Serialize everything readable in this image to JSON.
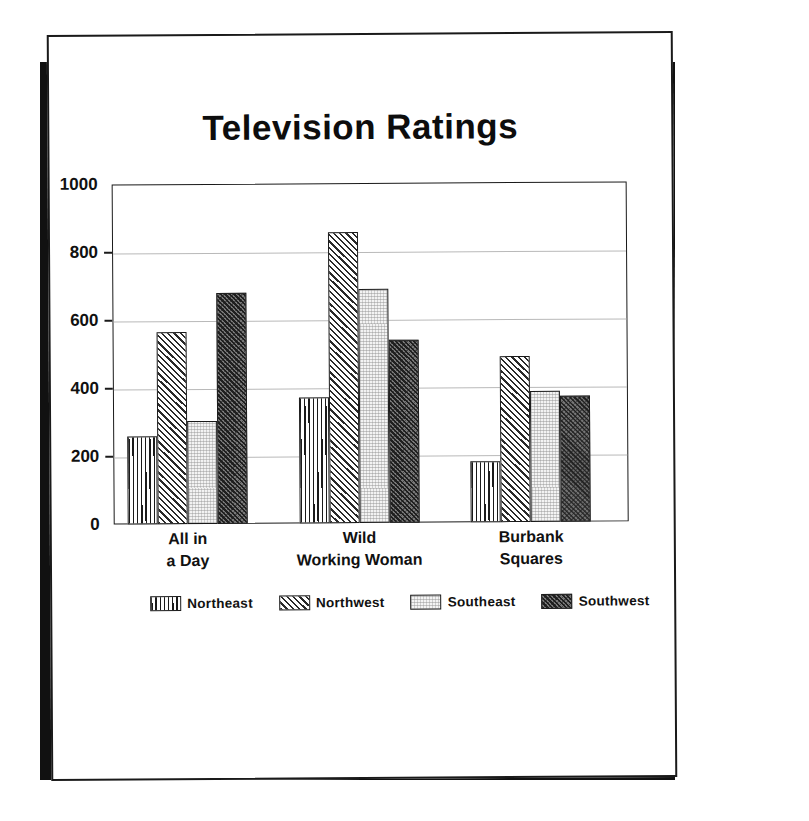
{
  "document": {
    "kind": "printed-chart-page"
  },
  "chart_data": {
    "type": "bar",
    "title": "Television Ratings",
    "xlabel": "",
    "ylabel": "",
    "ylim": [
      0,
      1000
    ],
    "yticks": [
      0,
      200,
      400,
      600,
      800,
      1000
    ],
    "ytick_labels": [
      "0",
      "200",
      "400",
      "600",
      "800",
      "1000"
    ],
    "grid": true,
    "legend_position": "bottom",
    "categories": [
      "All in a Day",
      "Wild Working Woman",
      "Burbank Squares"
    ],
    "category_lines": [
      [
        "All in",
        "a Day"
      ],
      [
        "Wild",
        "Working Woman"
      ],
      [
        "Burbank",
        "Squares"
      ]
    ],
    "series": [
      {
        "name": "Northeast",
        "pattern": "vertical-lines",
        "values": [
          258,
          370,
          178
        ]
      },
      {
        "name": "Northwest",
        "pattern": "diagonal-hatch",
        "values": [
          565,
          855,
          488
        ]
      },
      {
        "name": "Southeast",
        "pattern": "light-stipple",
        "values": [
          303,
          688,
          385
        ]
      },
      {
        "name": "Southwest",
        "pattern": "dense-diagonal-hatch",
        "values": [
          678,
          538,
          372
        ]
      }
    ]
  },
  "colors": {
    "ink": "#1a1a1a",
    "grid": "#b9b9b9",
    "paper": "#ffffff",
    "shadow": "#111111"
  }
}
